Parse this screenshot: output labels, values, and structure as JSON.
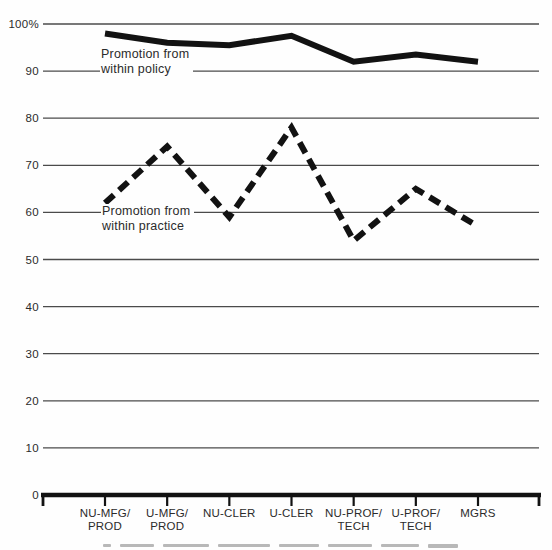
{
  "chart_data": {
    "type": "line",
    "title": "",
    "xlabel": "",
    "ylabel": "",
    "unit": "%",
    "ylim": [
      0,
      100
    ],
    "grid": "horizontal-only",
    "legend_position": "inline-annotations",
    "categories": [
      "NU-MFG/\nPROD",
      "U-MFG/\nPROD",
      "NU-CLER",
      "U-CLER",
      "NU-PROF/\nTECH",
      "U-PROF/\nTECH",
      "MGRS"
    ],
    "series": [
      {
        "name": "Promotion from within policy",
        "line_style": "solid",
        "values": [
          98,
          96,
          95.5,
          97.5,
          92,
          93.5,
          92
        ]
      },
      {
        "name": "Promotion from within practice",
        "line_style": "dashed",
        "values": [
          62,
          74,
          59,
          78,
          54,
          65,
          57
        ]
      }
    ],
    "annotations": [
      {
        "text": "Promotion from\nwithin policy",
        "attached_series": "Promotion from within policy"
      },
      {
        "text": "Promotion from\nwithin practice",
        "attached_series": "Promotion from within practice"
      }
    ],
    "y_ticks": [
      {
        "value": 100,
        "label": "100%"
      },
      {
        "value": 90,
        "label": "90"
      },
      {
        "value": 80,
        "label": "80"
      },
      {
        "value": 70,
        "label": "70"
      },
      {
        "value": 60,
        "label": "60"
      },
      {
        "value": 50,
        "label": "50"
      },
      {
        "value": 40,
        "label": "40"
      },
      {
        "value": 30,
        "label": "30"
      },
      {
        "value": 20,
        "label": "20"
      },
      {
        "value": 10,
        "label": "10"
      },
      {
        "value": 0,
        "label": "0"
      }
    ],
    "colors": {
      "line": "#121212",
      "grid": "#4b4b4b",
      "text": "#2b2b2b",
      "background": "#fefefe"
    }
  }
}
